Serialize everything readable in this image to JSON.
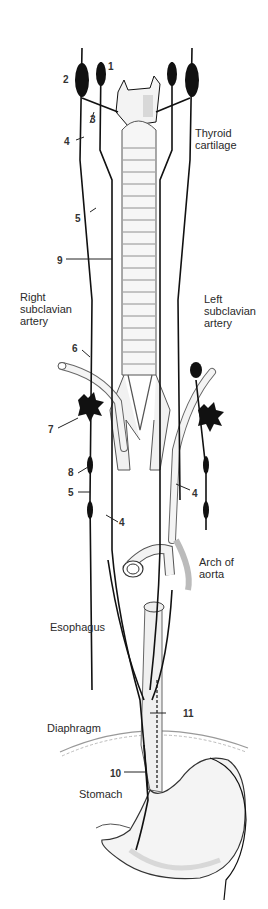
{
  "diagram": {
    "labels": {
      "thyroid_cartilage": "Thyroid\ncartilage",
      "right_subclavian_artery": "Right\nsubclavian\nartery",
      "left_subclavian_artery": "Left\nsubclavian\nartery",
      "arch_of_aorta": "Arch of\naorta",
      "esophagus": "Esophagus",
      "diaphragm": "Diaphragm",
      "stomach": "Stomach"
    },
    "numbers": {
      "n1": "1",
      "n2": "2",
      "n3": "3",
      "n4_top": "4",
      "n5_top": "5",
      "n9": "9",
      "n6": "6",
      "n7": "7",
      "n8": "8",
      "n5_low": "5",
      "n4_left": "4",
      "n4_right": "4",
      "n11": "11",
      "n10": "10"
    },
    "colors": {
      "ink": "#111111",
      "shade": "#cfcfcf",
      "paper": "#ffffff"
    }
  }
}
